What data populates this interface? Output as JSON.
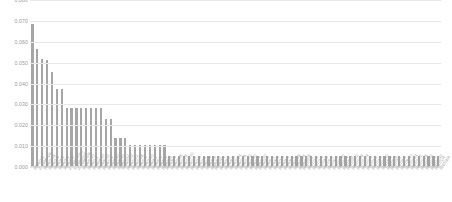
{
  "chart_data": {
    "type": "bar",
    "title": "",
    "subtitle": "",
    "xlabel": "",
    "ylabel": "",
    "ylim": [
      0.0,
      0.08
    ],
    "grid": true,
    "legend": false,
    "legend_position": "none",
    "bar_color": "#a6a6a6",
    "gridline_color": "#e8e8e8",
    "tick_label_color": "#9a9a9a",
    "ytick_labels": [
      "0.080",
      "0.070",
      "0.060",
      "0.050",
      "0.040",
      "0.030",
      "0.020",
      "0.010",
      "0.000"
    ],
    "ytick_values": [
      0.08,
      0.07,
      0.06,
      0.05,
      0.04,
      0.03,
      0.02,
      0.01,
      0.0
    ],
    "categories": [
      "1996/3/8",
      "2. 1996/3/8",
      "1996/3/16",
      "1996/3/4",
      "1996/4/6",
      "1996/7/8",
      "1996/3/6",
      "2. 1996/7/10",
      "1. 1996/1/4",
      "2. 1996/2/8",
      "1996/5/10",
      "1996/2/2",
      "1996/4/10",
      "1996/6/10",
      "1996/1/8",
      "1996/7/10",
      "1996/9/10",
      "1996/3/12",
      "1996/10/2",
      "1996/11/2",
      "1996/12/6",
      "1996/1/6",
      "1996/2/10",
      "1996/4/2",
      "1996/5/4",
      "1996/6/6",
      "1996/8/8",
      "1996/9/4",
      "1996/10/6",
      "1996/11/8",
      "1996/12/10",
      "1996/1/2",
      "1996/2/6",
      "1996/3/2",
      "1996/4/4",
      "1996/5/6",
      "1996/6/2",
      "1996/7/4",
      "1996/8/2",
      "1996/9/6",
      "1996/10/4",
      "1996/11/6",
      "1996/12/2",
      "1996/1/10",
      "1996/2/4",
      "1996/3/10",
      "1996/4/8",
      "1996/5/2",
      "1996/6/4",
      "1996/7/6",
      "1996/8/4",
      "1996/9/2",
      "1996/10/8",
      "1996/11/4",
      "1996/12/8",
      "1997/1/2",
      "1997/2/6",
      "1997/3/4",
      "1997/4/8",
      "1997/5/2",
      "1997/6/6",
      "1997/7/10",
      "1997/8/4",
      "1997/9/8",
      "1997/10/2",
      "1997/11/6",
      "1997/12/4",
      "1997/1/8",
      "1997/2/2",
      "1997/3/6",
      "1997/4/10",
      "1997/5/4",
      "1997/6/8",
      "1997/7/2",
      "1997/8/6",
      "1997/9/10",
      "1997/10/4",
      "1997/11/2",
      "1997/12/6",
      "1997/1/12",
      "1997/2/8",
      "1997/3/10",
      "1997/1/4",
      "1997/4/4"
    ],
    "values": [
      0.0685,
      0.0565,
      0.0515,
      0.051,
      0.0455,
      0.037,
      0.037,
      0.028,
      0.028,
      0.028,
      0.028,
      0.028,
      0.028,
      0.028,
      0.028,
      0.0225,
      0.0225,
      0.0135,
      0.0135,
      0.0135,
      0.01,
      0.01,
      0.01,
      0.01,
      0.01,
      0.01,
      0.01,
      0.01,
      0.0048,
      0.0048,
      0.0048,
      0.0048,
      0.0048,
      0.0048,
      0.0048,
      0.0048,
      0.0048,
      0.0048,
      0.0048,
      0.0048,
      0.0048,
      0.0048,
      0.0048,
      0.0048,
      0.0048,
      0.0048,
      0.0048,
      0.0048,
      0.0048,
      0.0048,
      0.0048,
      0.0048,
      0.0048,
      0.0048,
      0.0048,
      0.0048,
      0.0048,
      0.0048,
      0.0048,
      0.0048,
      0.0048,
      0.0048,
      0.0048,
      0.0048,
      0.0048,
      0.0048,
      0.0048,
      0.0048,
      0.0048,
      0.0048,
      0.0048,
      0.0048,
      0.0048,
      0.0048,
      0.0048,
      0.0048,
      0.0048,
      0.0048,
      0.0048,
      0.0048,
      0.0048,
      0.0048,
      0.0048,
      0.0048
    ]
  }
}
